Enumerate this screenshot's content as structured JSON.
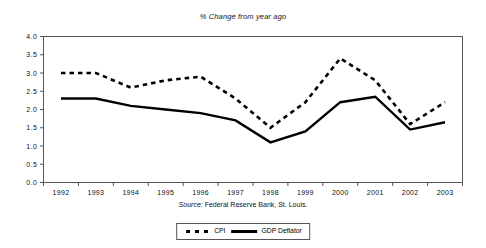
{
  "chart_data": {
    "type": "line",
    "title": "% Change from year ago",
    "xlabel": "",
    "ylabel": "",
    "ylim": [
      0.0,
      4.0
    ],
    "ytick_step": 0.5,
    "grid": false,
    "legend_position": "bottom-center",
    "source_note": "Source: Federal Reserve Bank, St. Louis.",
    "source_label": "Source:",
    "source_text": " Federal Reserve Bank, St. Louis.",
    "categories": [
      "1992",
      "1993",
      "1994",
      "1995",
      "1996",
      "1997",
      "1998",
      "1999",
      "2000",
      "2001",
      "2002",
      "2003"
    ],
    "ytick_labels": [
      "0.0",
      "0.5",
      "1.0",
      "1.5",
      "2.0",
      "2.5",
      "3.0",
      "3.5",
      "4.0"
    ],
    "ytick_values": [
      0.0,
      0.5,
      1.0,
      1.5,
      2.0,
      2.5,
      3.0,
      3.5,
      4.0
    ],
    "series": [
      {
        "name": "CPI",
        "style": "dashed",
        "color": "#000000",
        "values": [
          3.0,
          3.0,
          2.6,
          2.8,
          2.9,
          2.3,
          1.5,
          2.2,
          3.4,
          2.8,
          1.6,
          2.2
        ]
      },
      {
        "name": "GDP  Deflator",
        "style": "solid",
        "color": "#000000",
        "values": [
          2.3,
          2.3,
          2.1,
          2.0,
          1.9,
          1.7,
          1.1,
          1.4,
          2.2,
          2.35,
          1.45,
          1.65
        ]
      }
    ]
  }
}
